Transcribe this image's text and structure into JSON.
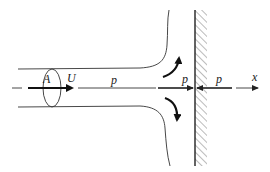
{
  "diagram": {
    "type": "jet impinging on wall",
    "labels": {
      "area": "A",
      "velocity": "U",
      "pressure_jet": "p",
      "pressure_left_of_wall": "p",
      "pressure_right_of_wall": "p",
      "axis": "x"
    },
    "colors": {
      "line": "#333333",
      "arrow": "#111111",
      "background": "#ffffff"
    }
  }
}
